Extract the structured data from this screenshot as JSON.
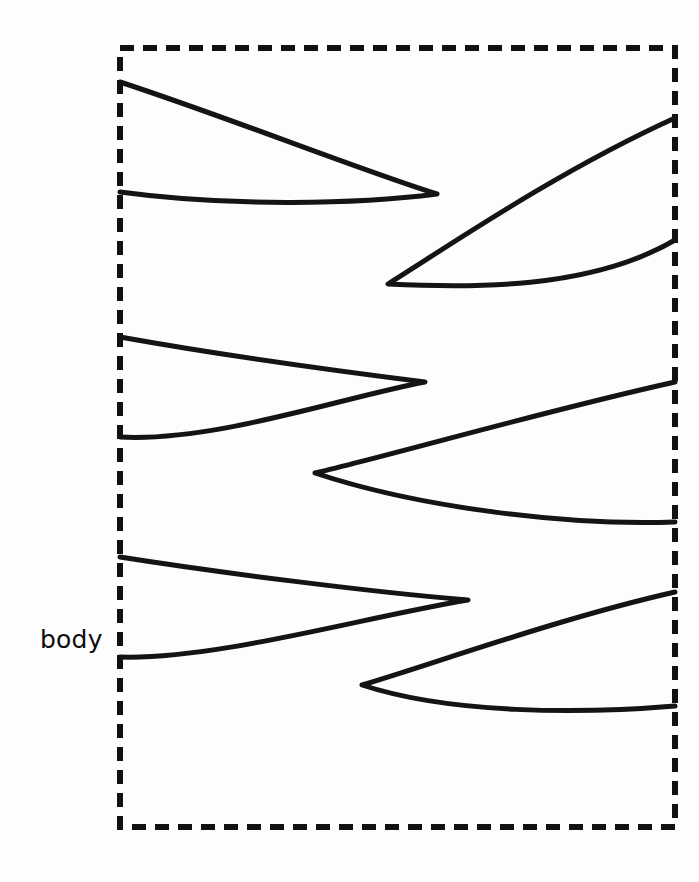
{
  "canvas": {
    "width": 699,
    "height": 882,
    "background_color": "#fdfdfd",
    "stroke_color": "#141414"
  },
  "labels": {
    "body": "body"
  },
  "body_region": {
    "name": "body",
    "style": "dashed-rectangle",
    "stroke_color": "#111111",
    "stroke_width": 6,
    "dash_length": 14,
    "gap_length": 9,
    "x": 120,
    "y": 48,
    "width": 555,
    "height": 779
  },
  "label_positions": {
    "body": {
      "x": 40,
      "y": 648
    }
  },
  "fins": [
    {
      "id": "fin-left-1",
      "side": "left",
      "root_top": {
        "x": 120,
        "y": 82
      },
      "root_bottom": {
        "x": 120,
        "y": 192
      },
      "tip": {
        "x": 437,
        "y": 194
      },
      "path": "M 120 82 C 230 118 360 170 437 194 C 360 204 230 207 120 192"
    },
    {
      "id": "fin-right-1",
      "side": "right",
      "root_top": {
        "x": 675,
        "y": 118
      },
      "root_bottom": {
        "x": 675,
        "y": 240
      },
      "tip": {
        "x": 388,
        "y": 284
      },
      "path": "M 675 118 C 560 170 450 245 388 284 C 470 288 590 290 675 240"
    },
    {
      "id": "fin-left-2",
      "side": "left",
      "root_top": {
        "x": 120,
        "y": 337
      },
      "root_bottom": {
        "x": 120,
        "y": 437
      },
      "tip": {
        "x": 425,
        "y": 382
      },
      "path": "M 120 337 C 215 354 345 372 425 382 C 340 398 215 442 120 437"
    },
    {
      "id": "fin-right-2",
      "side": "right",
      "root_top": {
        "x": 675,
        "y": 382
      },
      "root_bottom": {
        "x": 675,
        "y": 522
      },
      "tip": {
        "x": 315,
        "y": 473
      },
      "path": "M 675 382 C 540 412 400 453 315 473 C 420 508 570 526 675 522"
    },
    {
      "id": "fin-left-3",
      "side": "left",
      "root_top": {
        "x": 120,
        "y": 557
      },
      "root_bottom": {
        "x": 120,
        "y": 657
      },
      "tip": {
        "x": 468,
        "y": 600
      },
      "path": "M 120 557 C 215 572 370 592 468 600 C 360 618 215 660 120 657"
    },
    {
      "id": "fin-right-3",
      "side": "right",
      "root_top": {
        "x": 675,
        "y": 592
      },
      "root_bottom": {
        "x": 675,
        "y": 706
      },
      "tip": {
        "x": 362,
        "y": 685
      },
      "path": "M 675 592 C 560 618 430 665 362 685 C 450 714 580 714 675 706"
    }
  ]
}
